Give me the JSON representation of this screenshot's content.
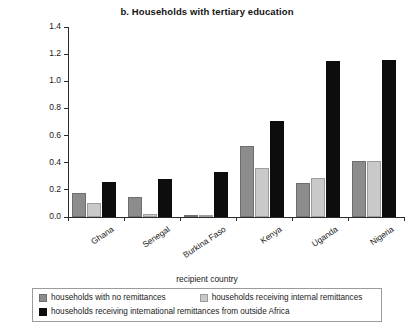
{
  "chart_data": {
    "type": "bar",
    "title": "b. Households with tertiary education",
    "xlabel": "recipient country",
    "ylabel": "average number in household with tertiary education",
    "categories": [
      "Ghana",
      "Senegal",
      "Burkina Faso",
      "Kenya",
      "Uganda",
      "Nigeria"
    ],
    "series": [
      {
        "name": "households with no remittances",
        "color": "#8c8c8c",
        "values": [
          0.18,
          0.15,
          0.01,
          0.52,
          0.25,
          0.41
        ]
      },
      {
        "name": "households receiving internal remittances",
        "color": "#c9c9c9",
        "values": [
          0.1,
          0.02,
          0.01,
          0.36,
          0.29,
          0.41
        ]
      },
      {
        "name": "households receiving international remittances from outside Africa",
        "color": "#0d0d0d",
        "values": [
          0.26,
          0.28,
          0.33,
          0.71,
          1.15,
          1.16
        ]
      }
    ],
    "ylim": [
      0.0,
      1.4
    ],
    "yticks": [
      "0.0",
      "0.2",
      "0.4",
      "0.6",
      "0.8",
      "1.0",
      "1.2",
      "1.4"
    ],
    "ytick_values": [
      0.0,
      0.2,
      0.4,
      0.6,
      0.8,
      1.0,
      1.2,
      1.4
    ],
    "grid": false,
    "legend_position": "bottom"
  }
}
